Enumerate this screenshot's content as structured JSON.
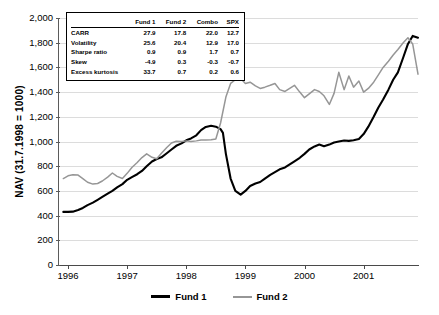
{
  "chart_data": {
    "type": "line",
    "title": "",
    "xlabel": "",
    "ylabel": "NAV (31.7.1998 = 1000)",
    "xlim": [
      1995.83,
      2001.92
    ],
    "ylim": [
      0,
      2000
    ],
    "yticks": [
      0,
      200,
      400,
      600,
      800,
      1000,
      1200,
      1400,
      1600,
      1800,
      2000
    ],
    "ytick_labels": [
      "0",
      "200",
      "400",
      "600",
      "800",
      "1,000",
      "1,200",
      "1,400",
      "1,600",
      "1,800",
      "2,000"
    ],
    "xticks": [
      1996,
      1997,
      1998,
      1999,
      2000,
      2001
    ],
    "xtick_labels": [
      "1996",
      "1997",
      "1998",
      "1999",
      "2000",
      "2001"
    ],
    "grid": "horizontal",
    "legend_position": "bottom-center",
    "series": [
      {
        "name": "Fund 1",
        "color": "#000000",
        "x": [
          1995.92,
          1996.0,
          1996.08,
          1996.17,
          1996.25,
          1996.33,
          1996.42,
          1996.5,
          1996.58,
          1996.67,
          1996.75,
          1996.83,
          1996.92,
          1997.0,
          1997.08,
          1997.17,
          1997.25,
          1997.33,
          1997.42,
          1997.5,
          1997.58,
          1997.67,
          1997.75,
          1997.83,
          1997.92,
          1998.0,
          1998.08,
          1998.17,
          1998.25,
          1998.33,
          1998.42,
          1998.5,
          1998.58,
          1998.62,
          1998.67,
          1998.75,
          1998.83,
          1998.92,
          1999.0,
          1999.08,
          1999.17,
          1999.25,
          1999.33,
          1999.42,
          1999.5,
          1999.58,
          1999.67,
          1999.75,
          1999.83,
          1999.92,
          2000.0,
          2000.08,
          2000.17,
          2000.25,
          2000.33,
          2000.42,
          2000.5,
          2000.58,
          2000.67,
          2000.75,
          2000.83,
          2000.92,
          2001.0,
          2001.08,
          2001.17,
          2001.25,
          2001.33,
          2001.42,
          2001.5,
          2001.58,
          2001.67,
          2001.75,
          2001.83,
          2001.92
        ],
        "y": [
          430,
          430,
          432,
          445,
          462,
          485,
          505,
          528,
          552,
          578,
          600,
          628,
          655,
          690,
          712,
          735,
          762,
          800,
          838,
          858,
          872,
          905,
          935,
          965,
          985,
          1010,
          1025,
          1050,
          1092,
          1118,
          1128,
          1120,
          1100,
          1070,
          900,
          700,
          600,
          570,
          600,
          640,
          660,
          672,
          700,
          730,
          752,
          775,
          790,
          815,
          840,
          868,
          900,
          935,
          960,
          975,
          962,
          975,
          992,
          1000,
          1008,
          1005,
          1010,
          1020,
          1060,
          1120,
          1200,
          1275,
          1340,
          1420,
          1500,
          1560,
          1680,
          1790,
          1855,
          1840
        ]
      },
      {
        "name": "Fund 2",
        "color": "#969696",
        "x": [
          1995.92,
          1996.0,
          1996.08,
          1996.17,
          1996.25,
          1996.33,
          1996.42,
          1996.5,
          1996.58,
          1996.67,
          1996.75,
          1996.83,
          1996.92,
          1997.0,
          1997.08,
          1997.17,
          1997.25,
          1997.33,
          1997.42,
          1997.5,
          1997.58,
          1997.67,
          1997.75,
          1997.83,
          1997.92,
          1998.0,
          1998.08,
          1998.17,
          1998.25,
          1998.33,
          1998.42,
          1998.5,
          1998.58,
          1998.67,
          1998.75,
          1998.83,
          1998.92,
          1999.0,
          1999.08,
          1999.17,
          1999.25,
          1999.33,
          1999.42,
          1999.5,
          1999.58,
          1999.67,
          1999.75,
          1999.83,
          1999.92,
          2000.0,
          2000.08,
          2000.17,
          2000.25,
          2000.33,
          2000.42,
          2000.5,
          2000.58,
          2000.67,
          2000.75,
          2000.83,
          2000.92,
          2001.0,
          2001.08,
          2001.17,
          2001.25,
          2001.33,
          2001.42,
          2001.5,
          2001.58,
          2001.67,
          2001.75,
          2001.83,
          2001.92
        ],
        "y": [
          700,
          722,
          730,
          728,
          700,
          670,
          655,
          660,
          680,
          712,
          745,
          718,
          700,
          742,
          790,
          830,
          870,
          900,
          872,
          860,
          905,
          952,
          988,
          1002,
          1000,
          1005,
          1000,
          1005,
          1012,
          1012,
          1015,
          1020,
          1150,
          1360,
          1470,
          1500,
          1510,
          1470,
          1480,
          1450,
          1430,
          1440,
          1455,
          1470,
          1420,
          1405,
          1430,
          1455,
          1400,
          1355,
          1385,
          1420,
          1405,
          1370,
          1300,
          1390,
          1560,
          1420,
          1530,
          1440,
          1490,
          1400,
          1430,
          1480,
          1540,
          1600,
          1650,
          1700,
          1745,
          1800,
          1840,
          1790,
          1545
        ]
      }
    ],
    "stats_table": {
      "row_header": "",
      "columns": [
        "Fund 1",
        "Fund 2",
        "Combo",
        "SPX"
      ],
      "rows": [
        {
          "label": "CARR",
          "values": [
            "27.9",
            "17.8",
            "22.0",
            "12.7"
          ]
        },
        {
          "label": "Volatility",
          "values": [
            "25.6",
            "20.4",
            "12.9",
            "17.0"
          ]
        },
        {
          "label": "Sharpe ratio",
          "values": [
            "0.9",
            "0.9",
            "1.7",
            "0.7"
          ]
        },
        {
          "label": "Skew",
          "values": [
            "-4.9",
            "0.3",
            "-0.3",
            "-0.7"
          ]
        },
        {
          "label": "Excess kurtosis",
          "values": [
            "33.7",
            "0.7",
            "0.2",
            "0.6"
          ]
        }
      ]
    }
  }
}
